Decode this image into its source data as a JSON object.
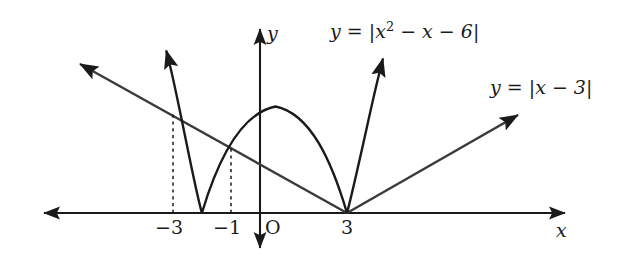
{
  "figure": {
    "kind": "coordinate-plane-graph",
    "width": 627,
    "height": 262,
    "background_color": "#ffffff",
    "stroke_color": "#1a1a1a"
  },
  "axes": {
    "x_axis_name": "x",
    "y_axis_name": "y",
    "origin_label": "O",
    "origin_px": {
      "x": 260,
      "y": 213
    },
    "x_unit_px": 29,
    "y_unit_px": 17.2,
    "x_range_px": {
      "left": 36,
      "right": 572
    },
    "y_range_px": {
      "top": 22,
      "bottom": 255
    },
    "x_ticks": [
      {
        "label": "−3",
        "value": -3,
        "px_x": 173
      },
      {
        "label": "−1",
        "value": -1,
        "px_x": 231
      },
      {
        "label": "3",
        "value": 3,
        "px_x": 347
      }
    ]
  },
  "curves": [
    {
      "name": "parabola-abs",
      "label": "y = |x² − x − 6|",
      "label_parts": {
        "lhs": "y",
        "eq": "=",
        "bar_open": "|",
        "expr_base": "x",
        "expr_exp": "2",
        "expr_rest": "− x − 6",
        "bar_close": "|"
      },
      "expression": "|x^2 - x - 6|",
      "roots": [
        -2,
        3
      ],
      "vertex": {
        "x": 0.5,
        "y": 6.25
      },
      "label_px": {
        "x": 330,
        "y": 22
      }
    },
    {
      "name": "line-abs",
      "label": "y = |x − 3|",
      "label_parts": {
        "lhs": "y",
        "eq": "=",
        "bar_open": "|",
        "expr": "x − 3",
        "bar_close": "|"
      },
      "expression": "|x - 3|",
      "vertex": {
        "x": 3,
        "y": 0
      },
      "slopes": [
        -1,
        1
      ],
      "label_px": {
        "x": 490,
        "y": 78
      }
    }
  ],
  "intersections": [
    {
      "x": -3,
      "y": 6,
      "dashed_guide": true
    },
    {
      "x": -1,
      "y": 4,
      "dashed_guide": true
    },
    {
      "x": 3,
      "y": 0,
      "dashed_guide": false
    }
  ],
  "dashed_guides": [
    {
      "at_x": -3,
      "px_x": 173,
      "from_px_y": 213,
      "to_px_y": 113
    },
    {
      "at_x": -1,
      "px_x": 231,
      "from_px_y": 213,
      "to_px_y": 145
    }
  ]
}
